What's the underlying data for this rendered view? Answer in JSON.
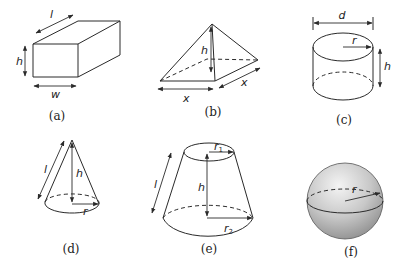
{
  "figures": [
    {
      "id": "a",
      "shape": "rectangular-prism",
      "caption": "(a)",
      "labels": {
        "length": "l",
        "height": "h",
        "width": "w"
      }
    },
    {
      "id": "b",
      "shape": "square-pyramid",
      "caption": "(b)",
      "labels": {
        "height": "h",
        "base_side_1": "x",
        "base_side_2": "x"
      }
    },
    {
      "id": "c",
      "shape": "cylinder",
      "caption": "(c)",
      "labels": {
        "diameter": "d",
        "radius": "r",
        "height": "h"
      }
    },
    {
      "id": "d",
      "shape": "cone",
      "caption": "(d)",
      "labels": {
        "slant": "l",
        "height": "h",
        "radius": "r"
      }
    },
    {
      "id": "e",
      "shape": "frustum",
      "caption": "(e)",
      "labels": {
        "slant": "l",
        "height": "h",
        "top_radius": "r",
        "top_radius_sub": "1",
        "bottom_radius": "r",
        "bottom_radius_sub": "2"
      }
    },
    {
      "id": "f",
      "shape": "sphere",
      "caption": "(f)",
      "labels": {
        "radius": "r"
      }
    }
  ],
  "colors": {
    "stroke": "#2a2a2a",
    "sphere_light": "#f2f2f2",
    "sphere_dark": "#9a9a9a"
  }
}
